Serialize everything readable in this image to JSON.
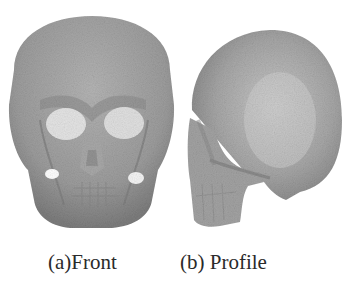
{
  "figure": {
    "panels": [
      {
        "id": "a",
        "label": "(a)Front",
        "subject": "3D skull reconstruction, frontal view"
      },
      {
        "id": "b",
        "label": "(b) Profile",
        "subject": "3D skull reconstruction, lateral/posterior-oblique view"
      }
    ],
    "colors": {
      "background": "#ffffff",
      "bone_base": "#9a9a9a",
      "bone_light": "#c4c4c4",
      "bone_dark": "#7a7a7a",
      "highlight": "#e6e6e6",
      "caption_text": "#2a2a2a"
    }
  }
}
